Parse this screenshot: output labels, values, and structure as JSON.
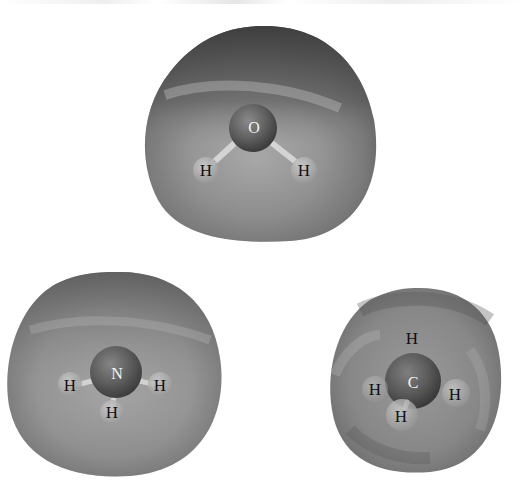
{
  "figure": {
    "molecules": [
      {
        "name": "water",
        "central_atom": "O",
        "hydrogens": [
          "H",
          "H"
        ]
      },
      {
        "name": "ammonia",
        "central_atom": "N",
        "hydrogens": [
          "H",
          "H",
          "H"
        ]
      },
      {
        "name": "methane",
        "central_atom": "C",
        "hydrogens": [
          "H",
          "H",
          "H",
          "H"
        ]
      }
    ]
  },
  "colors": {
    "background": "#ffffff",
    "surface_dark": "#4a4a4a",
    "surface_mid": "#8a8a8a",
    "surface_light": "#bdbdbd",
    "central_atom": "#5a5a5a",
    "hydrogen_atom": "#a8a8a8",
    "label_dark": "#111111",
    "label_light": "#f4f4f4"
  }
}
